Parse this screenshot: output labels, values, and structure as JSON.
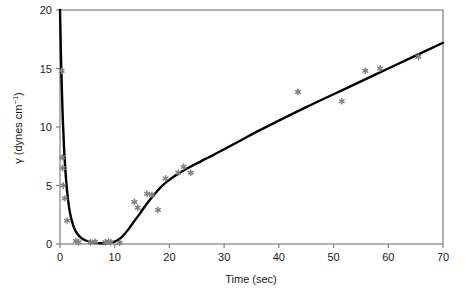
{
  "chart_data": {
    "type": "scatter",
    "title": "",
    "xlabel": "Time (sec)",
    "ylabel": "γ (dynes cm⁻¹)",
    "ylabel_symbol": "γ",
    "ylabel_unit_text": "(dynes cm",
    "ylabel_unit_sup": "−1",
    "ylabel_unit_close": ")",
    "xlim": [
      0,
      70
    ],
    "ylim": [
      0,
      20
    ],
    "xticks": [
      0,
      10,
      20,
      30,
      40,
      50,
      60,
      70
    ],
    "yticks": [
      0,
      5,
      10,
      15,
      20
    ],
    "xtick_labels": [
      "0",
      "10",
      "20",
      "30",
      "40",
      "50",
      "60",
      "70"
    ],
    "ytick_labels": [
      "0",
      "5",
      "10",
      "15",
      "20"
    ],
    "grid": false,
    "legend": "none",
    "marker_color": "#808080",
    "line_color": "#000000",
    "axis_color": "#808080",
    "frame_color": "#808080",
    "series": [
      {
        "name": "measured",
        "type": "scatter",
        "marker": "star",
        "x": [
          0.3,
          0.4,
          0.5,
          0.6,
          0.9,
          1.3,
          2.9,
          3.4,
          5.6,
          6.4,
          8.3,
          8.9,
          9.3,
          10.9,
          13.6,
          14.2,
          15.9,
          16.8,
          17.9,
          19.3,
          21.6,
          22.6,
          23.9,
          43.5,
          51.5,
          55.8,
          58.5,
          65.5
        ],
        "y": [
          14.8,
          7.4,
          6.5,
          5.0,
          3.9,
          2.0,
          0.25,
          0.15,
          0.15,
          0.2,
          0.15,
          0.2,
          0.15,
          0.1,
          3.6,
          3.1,
          4.3,
          4.2,
          2.9,
          5.6,
          6.1,
          6.6,
          6.1,
          13.0,
          12.2,
          14.8,
          15.0,
          16.0
        ]
      },
      {
        "name": "fitted curve",
        "type": "line",
        "x": [
          0.0,
          0.25,
          0.5,
          0.75,
          1.0,
          1.3,
          1.7,
          2.1,
          2.6,
          3.2,
          3.9,
          4.7,
          5.6,
          6.5,
          7.4,
          8.3,
          9.2,
          10.0,
          10.8,
          11.6,
          12.5,
          13.5,
          14.6,
          15.8,
          17.0,
          18.3,
          19.6,
          20.9,
          22.1,
          23.2,
          24.2,
          25.3,
          26.5,
          28.0,
          30.0,
          33.0,
          36.0,
          40.0,
          45.0,
          50.0,
          55.0,
          60.0,
          65.0,
          70.0
        ],
        "y": [
          20.0,
          14.6,
          10.8,
          8.1,
          6.2,
          4.5,
          3.0,
          2.1,
          1.35,
          0.85,
          0.5,
          0.3,
          0.17,
          0.1,
          0.07,
          0.07,
          0.12,
          0.2,
          0.4,
          0.75,
          1.25,
          1.9,
          2.6,
          3.4,
          4.1,
          4.8,
          5.35,
          5.8,
          6.15,
          6.45,
          6.7,
          6.95,
          7.25,
          7.6,
          8.1,
          8.85,
          9.6,
          10.55,
          11.7,
          12.8,
          13.9,
          15.0,
          16.1,
          17.2
        ]
      }
    ]
  }
}
